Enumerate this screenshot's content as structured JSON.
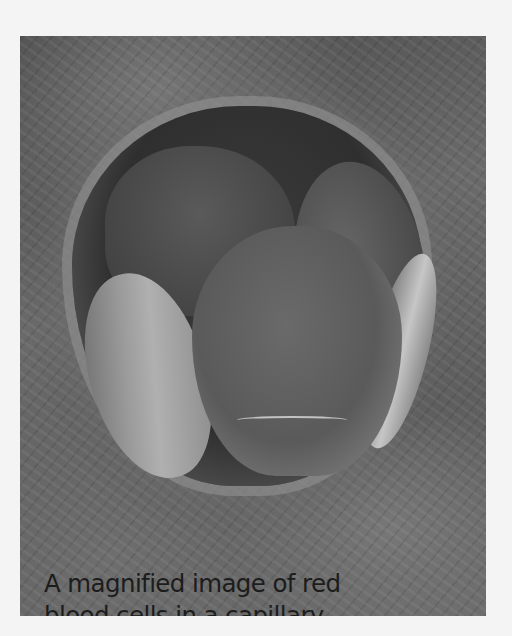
{
  "image": {
    "subject": "scanning electron micrograph of red blood cells inside a capillary",
    "background_color": "#f4f4f4",
    "tone": "grayscale"
  },
  "caption": {
    "lines": [
      "A magnified image of red",
      "blood cells in a capillary"
    ]
  }
}
